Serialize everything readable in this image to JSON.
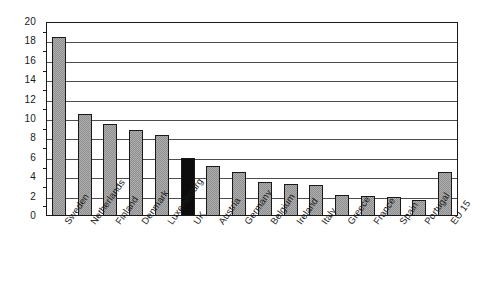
{
  "chart_data": {
    "type": "bar",
    "title": "",
    "subtitle": "",
    "xlabel": "",
    "ylabel": "",
    "ylim": [
      0,
      20
    ],
    "ytick_step": 2,
    "yticks": [
      "0",
      "2",
      "4",
      "6",
      "8",
      "10",
      "12",
      "14",
      "16",
      "18",
      "20"
    ],
    "grid": true,
    "grid_axis": "y",
    "legend": false,
    "legend_position": "none",
    "categories": [
      "Sweden",
      "Netherlands",
      "Finland",
      "Denmark",
      "Luxembourg",
      "UK",
      "Austria",
      "Germany",
      "Belgium",
      "Ireland",
      "Italy",
      "Greece",
      "France",
      "Spain",
      "Portugal",
      "EU 15"
    ],
    "values": [
      18.5,
      10.5,
      9.5,
      8.9,
      8.4,
      6.0,
      5.2,
      4.5,
      3.5,
      3.3,
      3.2,
      2.2,
      2.05,
      1.95,
      1.7,
      4.5
    ],
    "bar_colors": [
      "#8f8f8f",
      "#8f8f8f",
      "#8f8f8f",
      "#8f8f8f",
      "#8f8f8f",
      "#0d0d0d",
      "#8f8f8f",
      "#8f8f8f",
      "#8f8f8f",
      "#8f8f8f",
      "#8f8f8f",
      "#8f8f8f",
      "#8f8f8f",
      "#8f8f8f",
      "#8f8f8f",
      "#8f8f8f"
    ],
    "highlight_category": "UK",
    "highlight_color": "#0d0d0d",
    "default_bar_color": "#8f8f8f",
    "bar_edge_color": "#1a1a1a",
    "gridline_color": "#4d4d4d",
    "frame_color": "#1a1a1a",
    "background_color": "#ffffff",
    "label_rotation_degrees": -55
  }
}
